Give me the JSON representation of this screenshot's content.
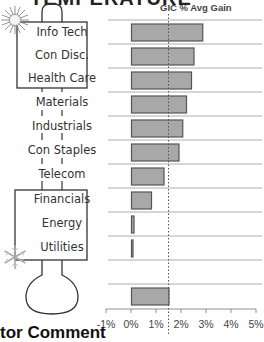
{
  "header": {
    "title_partial": "TEMPERATURE"
  },
  "footer": {
    "text_partial": "tor Comment"
  },
  "thermometer": {
    "hot_icon": "sun-icon",
    "cold_icon": "snowflake-icon",
    "sectors": [
      {
        "label": "Info Tech",
        "zone": "hot"
      },
      {
        "label": "Con Disc.",
        "zone": "hot"
      },
      {
        "label": "Health Care",
        "zone": "hot"
      },
      {
        "label": "Materials",
        "zone": "neutral"
      },
      {
        "label": "Industrials",
        "zone": "neutral"
      },
      {
        "label": "Con Staples",
        "zone": "neutral"
      },
      {
        "label": "Telecom",
        "zone": "neutral"
      },
      {
        "label": "Financials",
        "zone": "cold"
      },
      {
        "label": "Energy",
        "zone": "cold"
      },
      {
        "label": "Utilities",
        "zone": "cold"
      }
    ]
  },
  "chart_data": {
    "type": "bar",
    "orientation": "horizontal",
    "title": "GIC % Avg Gain",
    "xlabel": "",
    "ylabel": "",
    "categories": [
      "Info Tech",
      "Con Disc.",
      "Health Care",
      "Materials",
      "Industrials",
      "Con Staples",
      "Telecom",
      "Financials",
      "Energy",
      "Utilities",
      "",
      "Average"
    ],
    "values": [
      2.85,
      2.5,
      2.4,
      2.2,
      2.05,
      1.9,
      1.3,
      0.8,
      0.1,
      0.02,
      null,
      1.5
    ],
    "reference_line": {
      "value": 1.5,
      "style": "dotted"
    },
    "xlim": [
      -1,
      5
    ],
    "xticks": [
      "-1%",
      "0%",
      "1%",
      "2%",
      "3%",
      "4%",
      "5%"
    ],
    "grid": "horizontal",
    "colors": {
      "bar_fill": "#a8a8a8",
      "bar_stroke": "#555555",
      "grid": "#999999"
    }
  }
}
